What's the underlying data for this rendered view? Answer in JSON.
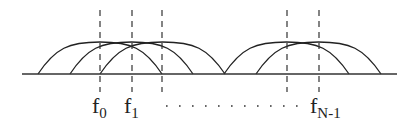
{
  "diagram": {
    "colors": {
      "line": "#222222",
      "background": "#ffffff"
    },
    "axis": {
      "x1": 22,
      "x2": 397,
      "y": 74
    },
    "dashed_lines": [
      {
        "x": 100
      },
      {
        "x": 132
      },
      {
        "x": 162
      },
      {
        "x": 287
      },
      {
        "x": 319
      }
    ],
    "curves": [
      {
        "start": 38,
        "end": 162,
        "peak_y": 42
      },
      {
        "start": 70,
        "end": 193,
        "peak_y": 42
      },
      {
        "start": 100,
        "end": 225,
        "peak_y": 42
      },
      {
        "start": 224,
        "end": 349,
        "peak_y": 42
      },
      {
        "start": 256,
        "end": 381,
        "peak_y": 42
      }
    ],
    "labels": [
      {
        "id": "f0",
        "base": "f",
        "sub": "0",
        "x": 100
      },
      {
        "id": "f1",
        "base": "f",
        "sub": "1",
        "x": 132
      },
      {
        "id": "fN-1",
        "base": "f",
        "sub": "N-1",
        "x": 318
      }
    ],
    "ellipsis": {
      "x1": 166,
      "x2": 302,
      "count": 11
    }
  }
}
